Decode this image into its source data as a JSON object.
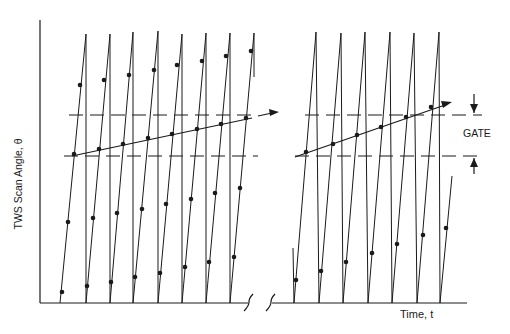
{
  "diagram": {
    "title": "",
    "y_axis_label": "TWS Scan Angle, θ",
    "x_axis_label": "Time, t",
    "gate_label": "GATE",
    "colors": {
      "ink": "#1a1a1a",
      "background": "#ffffff"
    },
    "panels": [
      {
        "name": "left",
        "sawtooth_sweeps": 8,
        "track_points_in_gate": 8
      },
      {
        "name": "right",
        "sawtooth_sweeps": 7,
        "track_points_in_gate": 6
      }
    ],
    "gate": {
      "upper_boundary": "dashed",
      "lower_boundary": "dashed"
    },
    "axis_break": "≈"
  }
}
